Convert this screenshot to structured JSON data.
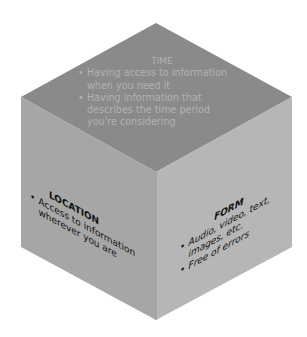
{
  "diagram": {
    "type": "isometric-cube",
    "colors": {
      "top_face": "#8a8a8a",
      "left_face": "#a6a6a6",
      "right_face": "#b6b6b6",
      "top_text": "#b2b2b2",
      "side_text": "#111111",
      "background": "#ffffff"
    },
    "faces": {
      "top": {
        "title": "TIME",
        "bullets": [
          "Having access to information",
          "when you need it",
          "Having information that",
          "describes the time period",
          "you're considering"
        ],
        "items": [
          "Having access to information when you need it",
          "Having information that describes the time period you're considering"
        ]
      },
      "left": {
        "title": "LOCATION",
        "items": [
          "Access to information wherever you are"
        ],
        "lines": [
          "Access to information",
          "wherever you are"
        ]
      },
      "right": {
        "title": "FORM",
        "items": [
          "Audio, video, text, images, etc.",
          "Free of errors"
        ],
        "lines": [
          "Audio, video, text,",
          "images, etc.",
          "Free of errors"
        ]
      }
    }
  }
}
